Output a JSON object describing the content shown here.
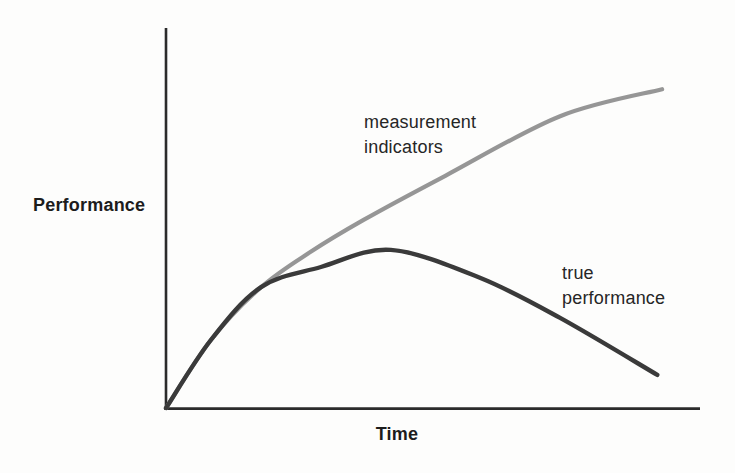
{
  "figure": {
    "background_color": "#fdfdfc",
    "axis_color": "#2b2b2b",
    "text_color": "#262626"
  },
  "chart_data": {
    "type": "line",
    "title": "",
    "xlabel": "Time",
    "ylabel": "Performance",
    "axes": {
      "x_range": [
        0,
        1
      ],
      "y_range": [
        0,
        1
      ],
      "tick_labels": [],
      "grid": false,
      "note": "conceptual sketch chart, unlabeled normalized axes"
    },
    "legend_position": "labels-on-chart",
    "series": [
      {
        "name": "measurement indicators",
        "label": "measurement\nindicators",
        "color": "#969696",
        "points": [
          [
            0.0,
            0.0
          ],
          [
            0.084,
            0.179
          ],
          [
            0.178,
            0.318
          ],
          [
            0.271,
            0.411
          ],
          [
            0.37,
            0.495
          ],
          [
            0.523,
            0.611
          ],
          [
            0.738,
            0.768
          ],
          [
            0.929,
            0.839
          ]
        ]
      },
      {
        "name": "true performance",
        "label": "true\nperformance",
        "color": "#3a3a3a",
        "points": [
          [
            0.0,
            0.0
          ],
          [
            0.084,
            0.179
          ],
          [
            0.178,
            0.318
          ],
          [
            0.29,
            0.371
          ],
          [
            0.421,
            0.416
          ],
          [
            0.589,
            0.342
          ],
          [
            0.738,
            0.237
          ],
          [
            0.92,
            0.087
          ]
        ]
      }
    ]
  }
}
